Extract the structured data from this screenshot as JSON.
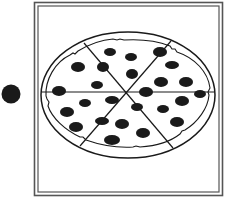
{
  "illustration": {
    "subject": "Pizza cut into slices with pepperoni",
    "frame_style": "double-line border",
    "slice_count": 6,
    "pepperoni_count": 24,
    "side_marker": "solid black dot",
    "colors": {
      "ink": "#1a1a1a",
      "frame": "#555555",
      "background": "#ffffff"
    }
  }
}
